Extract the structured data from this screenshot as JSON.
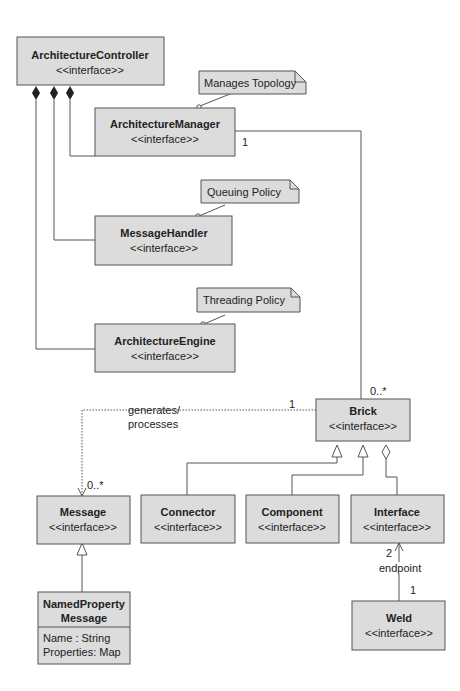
{
  "diagram": {
    "classes": {
      "architecture_controller": {
        "name": "ArchitectureController",
        "stereotype": "<<interface>>"
      },
      "architecture_manager": {
        "name": "ArchitectureManager",
        "stereotype": "<<interface>>"
      },
      "message_handler": {
        "name": "MessageHandler",
        "stereotype": "<<interface>>"
      },
      "architecture_engine": {
        "name": "ArchitectureEngine",
        "stereotype": "<<interface>>"
      },
      "brick": {
        "name": "Brick",
        "stereotype": "<<interface>>"
      },
      "message": {
        "name": "Message",
        "stereotype": "<<interface>>"
      },
      "connector": {
        "name": "Connector",
        "stereotype": "<<interface>>"
      },
      "component": {
        "name": "Component",
        "stereotype": "<<interface>>"
      },
      "interface": {
        "name": "Interface",
        "stereotype": "<<interface>>"
      },
      "named_property_message": {
        "name_line1": "NamedProperty",
        "name_line2": "Message",
        "attributes": [
          "Name : String",
          "Properties: Map"
        ]
      },
      "weld": {
        "name": "Weld",
        "stereotype": "<<interface>>"
      }
    },
    "notes": {
      "manages_topology": "Manages Topology",
      "queuing_policy": "Queuing Policy",
      "threading_policy": "Threading Policy"
    },
    "associations": {
      "manager_brick": {
        "source_mult": "1",
        "target_mult": "0..*"
      },
      "brick_message": {
        "label_line1": "generates/",
        "label_line2": "processes",
        "source_mult": "1",
        "target_mult": "0..*"
      },
      "weld_interface": {
        "label": "endpoint",
        "target_mult": "2",
        "source_mult": "1"
      }
    }
  }
}
